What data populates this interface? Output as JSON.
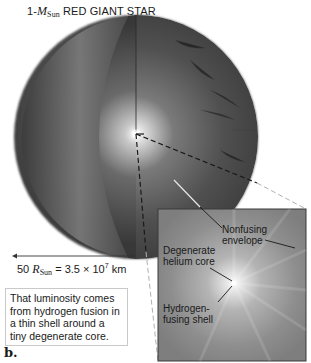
{
  "title": {
    "prefix": "1-",
    "mass_symbol": "M",
    "mass_subscript": "Sun",
    "text": "RED GIANT STAR"
  },
  "scale_bar": {
    "value": "50",
    "radius_symbol": "R",
    "radius_subscript": "Sun",
    "equals": "= 3.5 × 10",
    "exponent": "7",
    "unit": "km"
  },
  "caption": "That luminosity comes from hydrogen fusion in a thin shell around a tiny degenerate core.",
  "panel_label": "b.",
  "inset_labels": {
    "envelope_line1": "Nonfusing",
    "envelope_line2": "envelope",
    "core_line1": "Degenerate",
    "core_line2": "helium core",
    "shell_line1": "Hydrogen-",
    "shell_line2": "fusing shell"
  },
  "colors": {
    "star_dark": "#3a3a3a",
    "star_mid": "#6e6e6e",
    "inset_bg": "#8c8c8c",
    "core_glow": "#ffffff"
  }
}
